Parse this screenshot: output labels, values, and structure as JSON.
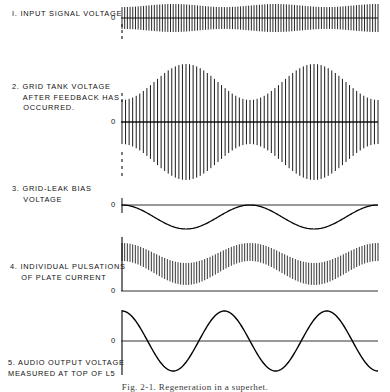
{
  "figure": {
    "title_caption": "Fig. 2-1. Regeneration in a superhet.",
    "background": "#ffffff",
    "ink_color": "#000000",
    "width": 390,
    "height": 391,
    "axis_x": 122,
    "plot_right": 378
  },
  "panels": [
    {
      "id": 1,
      "number": "1.",
      "label": "INPUT SIGNAL VOLTAGE",
      "label_lines": [
        "I. INPUT SIGNAL VOLTAGE"
      ],
      "zero_label": "0",
      "zero_y": 18,
      "label_x": 12,
      "label_y": 12,
      "zero_x": 112,
      "has_dashed_marker": true,
      "waveform_type": "dense-carrier-slight-AM"
    },
    {
      "id": 2,
      "number": "2.",
      "label": "GRID TANK VOLTAGE AFTER FEEDBACK HAS OCCURRED.",
      "label_lines": [
        "2. GRID TANK VOLTAGE",
        "    AFTER FEEDBACK HAS",
        "    OCCURRED."
      ],
      "zero_label": "0",
      "zero_y": 122,
      "label_x": 12,
      "label_y": 88,
      "zero_x": 112,
      "has_dashed_marker": true,
      "waveform_type": "carrier-strong-AM"
    },
    {
      "id": 3,
      "number": "3.",
      "label": "GRID-LEAK BIAS VOLTAGE",
      "label_lines": [
        "3. GRID-LEAK BIAS",
        "    VOLTAGE"
      ],
      "zero_label": "0",
      "zero_y": 205,
      "label_x": 12,
      "label_y": 187,
      "zero_x": 112,
      "has_dashed_marker": false,
      "waveform_type": "negative-going-sine"
    },
    {
      "id": 4,
      "number": "4.",
      "label": "INDIVIDUAL PULSATIONS OF PLATE CURRENT",
      "label_lines": [
        "4. INDIVIDUAL PULSATIONS",
        "    OF PLATE CURRENT"
      ],
      "zero_label": "0",
      "zero_y": 291,
      "label_x": 12,
      "label_y": 263,
      "zero_x": 112,
      "has_dashed_marker": false,
      "waveform_type": "pulsation-band"
    },
    {
      "id": 5,
      "number": "5.",
      "label": "AUDIO OUTPUT VOLTAGE MEASURED AT TOP OF L5",
      "label_lines": [
        "5. AUDIO OUTPUT VOLTAGE",
        "MEASURED AT TOP OF L5"
      ],
      "zero_label": "0",
      "zero_y": 341,
      "label_x": 8,
      "label_y": 360,
      "zero_x": 112,
      "has_dashed_marker": false,
      "waveform_type": "clean-sine"
    }
  ],
  "chart_data": {
    "type": "line",
    "xlabel": "",
    "ylabel": "",
    "series": [
      {
        "name": "1. Input signal voltage",
        "type": "amplitude-modulated-carrier",
        "carrier_cycles": 95,
        "envelope_cycles": 2.5,
        "envelope_depth": 0.22,
        "baseline_y": 18,
        "peak_amplitude": 14,
        "zero_label": "0"
      },
      {
        "name": "2. Grid tank voltage after feedback",
        "type": "amplitude-modulated-carrier",
        "carrier_cycles": 72,
        "envelope_cycles": 2.0,
        "envelope_depth": 0.62,
        "baseline_y": 122,
        "peak_amplitude": 58,
        "zero_label": "0"
      },
      {
        "name": "3. Grid-leak bias voltage",
        "type": "sine-negative-only",
        "cycles": 2.0,
        "baseline_y": 205,
        "peak_amplitude": 24,
        "zero_label": "0"
      },
      {
        "name": "4. Individual pulsations of plate current",
        "type": "pulsation-band",
        "pulse_count": 96,
        "envelope_cycles": 2.0,
        "baseline_y": 291,
        "band_top_mean": 48,
        "band_thickness": 18,
        "zero_label": "0"
      },
      {
        "name": "5. Audio output voltage at top of L5",
        "type": "sine",
        "cycles": 2.5,
        "baseline_y": 341,
        "peak_amplitude": 30,
        "starts_at": "positive-peak",
        "zero_label": "0"
      }
    ]
  }
}
